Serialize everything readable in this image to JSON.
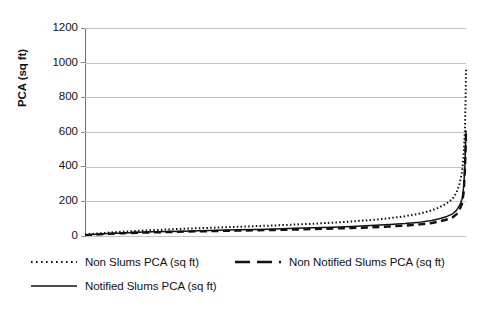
{
  "chart_data": {
    "type": "line",
    "title": "",
    "xlabel": "",
    "ylabel": "PCA (sq ft)",
    "ylim": [
      0,
      1200
    ],
    "ytick_labels": [
      "1200",
      "1000",
      "800",
      "600",
      "400",
      "200",
      "0"
    ],
    "ytick_values": [
      1200,
      1000,
      800,
      600,
      400,
      200,
      0
    ],
    "xlim": [
      0,
      100
    ],
    "xtick_labels": [],
    "grid": "horizontal",
    "legend_position": "bottom",
    "x": [
      0,
      2,
      4,
      6,
      8,
      10,
      14,
      18,
      22,
      26,
      30,
      35,
      40,
      45,
      50,
      55,
      60,
      65,
      70,
      75,
      80,
      84,
      88,
      91,
      93,
      95,
      96.5,
      97.5,
      98.3,
      99,
      99.4,
      99.7,
      99.9,
      100
    ],
    "series": [
      {
        "name": "Non Slums PCA (sq ft)",
        "style": "dotted",
        "peak": 960,
        "values": [
          8,
          12,
          16,
          19,
          22,
          25,
          30,
          34,
          38,
          42,
          45,
          49,
          53,
          57,
          61,
          66,
          71,
          77,
          84,
          92,
          103,
          114,
          130,
          148,
          165,
          190,
          215,
          250,
          300,
          375,
          470,
          600,
          790,
          960
        ]
      },
      {
        "name": "Non Notified Slums PCA (sq ft)",
        "style": "dashed",
        "peak": 600,
        "values": [
          5,
          8,
          10,
          12,
          14,
          16,
          19,
          21,
          23,
          25,
          27,
          29,
          31,
          33,
          35,
          37,
          40,
          43,
          46,
          50,
          55,
          60,
          67,
          75,
          84,
          95,
          108,
          125,
          150,
          190,
          255,
          370,
          500,
          600
        ]
      },
      {
        "name": "Notified Slums PCA (sq ft)",
        "style": "solid",
        "peak": 610,
        "values": [
          6,
          9,
          12,
          14,
          16,
          18,
          21,
          24,
          26,
          28,
          31,
          33,
          36,
          38,
          41,
          44,
          47,
          51,
          55,
          60,
          66,
          72,
          80,
          90,
          100,
          113,
          128,
          148,
          175,
          215,
          285,
          400,
          530,
          610
        ]
      }
    ],
    "colors": {
      "series_line": "#111111",
      "gridline": "#c3c3c3",
      "axis": "#6f6f6f",
      "text": "#111111",
      "background": "#ffffff"
    },
    "annotations": []
  },
  "legend": {
    "entries": [
      {
        "label": "Non Slums PCA (sq ft)",
        "marker": "dotted-line-marker"
      },
      {
        "label": "Non Notified Slums PCA (sq ft)",
        "marker": "dashed-line-marker"
      },
      {
        "label": "Notified Slums PCA (sq ft)",
        "marker": "solid-line-marker"
      }
    ]
  }
}
